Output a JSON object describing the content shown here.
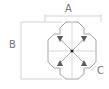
{
  "diagram": {
    "labels": {
      "a": "A",
      "b": "B",
      "c": "C"
    },
    "colors": {
      "line": "#9a9a9a",
      "shape": "#8a8a8a",
      "fill": "#555555",
      "text": "#777777"
    }
  }
}
